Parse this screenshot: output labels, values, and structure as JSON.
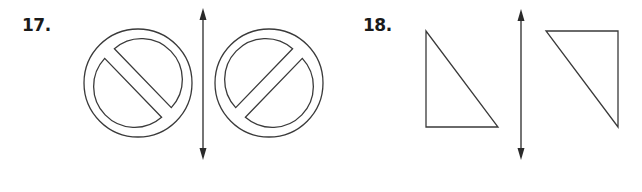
{
  "problems": [
    {
      "number": "17.",
      "original_figure": "prohibition-sign-slash-top-left-to-bottom-right",
      "reflected_figure": "prohibition-sign-slash-bottom-left-to-top-right",
      "line_of_reflection": "vertical"
    },
    {
      "number": "18.",
      "original_figure": "right-triangle-right-angle-bottom-left",
      "reflected_figure": "right-triangle-right-angle-top-right",
      "line_of_reflection": "vertical"
    }
  ],
  "colors": {
    "stroke": "#3a3a3a",
    "text": "#1a1a1a",
    "background": "#ffffff"
  }
}
